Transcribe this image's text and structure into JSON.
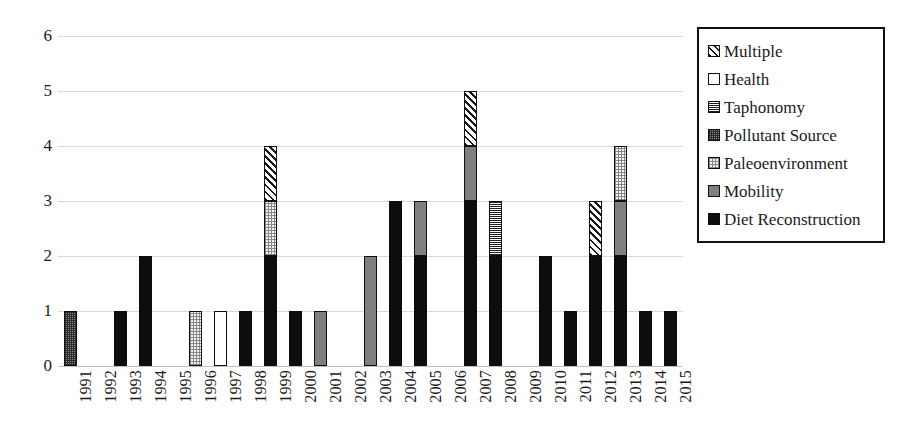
{
  "chart_data": {
    "type": "bar",
    "title": "",
    "subtitle": "",
    "xlabel": "",
    "ylabel": "",
    "stacked": true,
    "grid": true,
    "legend_position": "right",
    "ylim": [
      0,
      6
    ],
    "ytick_labels": [
      "6",
      "5",
      "4",
      "3",
      "2",
      "1",
      "0"
    ],
    "ytick_values": [
      6,
      5,
      4,
      3,
      2,
      1,
      0
    ],
    "categories": [
      "1991",
      "1992",
      "1993",
      "1994",
      "1995",
      "1996",
      "1997",
      "1998",
      "1999",
      "2000",
      "2001",
      "2002",
      "2003",
      "2004",
      "2005",
      "2006",
      "2007",
      "2008",
      "2009",
      "2010",
      "2011",
      "2012",
      "2013",
      "2014",
      "2015"
    ],
    "series": [
      {
        "name": "Diet Reconstruction",
        "pattern": "solid-black",
        "fill_class": "fill-diet",
        "values": [
          0,
          0,
          1,
          2,
          0,
          0,
          0,
          1,
          2,
          1,
          0,
          0,
          0,
          3,
          2,
          0,
          3,
          2,
          0,
          2,
          1,
          2,
          2,
          1,
          1
        ]
      },
      {
        "name": "Mobility",
        "pattern": "solid-gray",
        "fill_class": "fill-mobility",
        "values": [
          0,
          0,
          0,
          0,
          0,
          0,
          0,
          0,
          0,
          0,
          1,
          0,
          2,
          0,
          1,
          0,
          1,
          0,
          0,
          0,
          0,
          0,
          1,
          0,
          0
        ]
      },
      {
        "name": "Paleoenvironment",
        "pattern": "light-dotted",
        "fill_class": "fill-paleo",
        "values": [
          0,
          0,
          0,
          0,
          0,
          1,
          0,
          0,
          1,
          0,
          0,
          0,
          0,
          0,
          0,
          0,
          0,
          0,
          0,
          0,
          0,
          0,
          1,
          0,
          0
        ]
      },
      {
        "name": "Pollutant Source",
        "pattern": "dark-dotted",
        "fill_class": "fill-pollutant",
        "values": [
          1,
          0,
          0,
          0,
          0,
          0,
          0,
          0,
          0,
          0,
          0,
          0,
          0,
          0,
          0,
          0,
          0,
          0,
          0,
          0,
          0,
          0,
          0,
          0,
          0
        ]
      },
      {
        "name": "Taphonomy",
        "pattern": "horizontal-lines",
        "fill_class": "fill-taphonomy",
        "values": [
          0,
          0,
          0,
          0,
          0,
          0,
          0,
          0,
          0,
          0,
          0,
          0,
          0,
          0,
          0,
          0,
          0,
          1,
          0,
          0,
          0,
          0,
          0,
          0,
          0
        ]
      },
      {
        "name": "Health",
        "pattern": "white",
        "fill_class": "fill-health",
        "values": [
          0,
          0,
          0,
          0,
          0,
          0,
          1,
          0,
          0,
          0,
          0,
          0,
          0,
          0,
          0,
          0,
          0,
          0,
          0,
          0,
          0,
          0,
          0,
          0,
          0
        ]
      },
      {
        "name": "Multiple",
        "pattern": "diagonal-hatch",
        "fill_class": "fill-multiple",
        "values": [
          0,
          0,
          0,
          0,
          0,
          0,
          0,
          0,
          1,
          0,
          0,
          0,
          0,
          0,
          0,
          0,
          1,
          0,
          0,
          0,
          0,
          1,
          0,
          0,
          0
        ]
      }
    ],
    "totals": [
      1,
      0,
      1,
      2,
      0,
      1,
      1,
      1,
      4,
      1,
      1,
      0,
      2,
      3,
      3,
      0,
      5,
      3,
      0,
      2,
      1,
      3,
      4,
      1,
      1
    ]
  },
  "legend": {
    "items": [
      {
        "label": "Multiple",
        "fill_class": "fill-multiple"
      },
      {
        "label": "Health",
        "fill_class": "fill-health"
      },
      {
        "label": "Taphonomy",
        "fill_class": "fill-taphonomy"
      },
      {
        "label": "Pollutant Source",
        "fill_class": "fill-pollutant"
      },
      {
        "label": "Paleoenvironment",
        "fill_class": "fill-paleo"
      },
      {
        "label": "Mobility",
        "fill_class": "fill-mobility"
      },
      {
        "label": "Diet Reconstruction",
        "fill_class": "fill-diet"
      }
    ]
  },
  "colors": {
    "black": "#0d0d0d",
    "gray": "#7f7f7f",
    "gridline": "#d9d9d9",
    "background": "#ffffff",
    "text": "#1a1a1a"
  }
}
